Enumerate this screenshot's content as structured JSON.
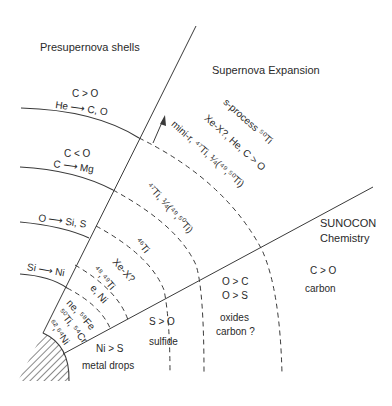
{
  "titles": {
    "presupernova": "Presupernova shells",
    "expansion": "Supernova Expansion",
    "sunocon_1": "SUNOCON",
    "sunocon_2": "Chemistry"
  },
  "shells": {
    "he_shell_ratio": "C > O",
    "he_shell_burn": "He ⟶ C, O",
    "c_shell_ratio": "C < O",
    "c_shell_burn": "C ⟶ Mg",
    "o_shell_burn": "O ⟶ Si, S",
    "si_shell_burn": "Si ⟶ Ni"
  },
  "expansion_labels": {
    "s_process": "s-process ⁵⁰Ti",
    "xe_he": "Xe-X?, He, C > O",
    "mini_r": "mini-r, ⁴⁷Ti, ¼(⁴⁹,⁵⁰Ti)",
    "ti47": "⁴⁷Ti, ¼(⁴⁹,⁵⁰Ti)",
    "ti46": "⁴⁶Ti",
    "xe_x": "Xe-X?",
    "ti48_49": "⁴⁸,⁴⁹Ti",
    "e_ni": "e, Ni",
    "ne_fe": "ne, ⁵⁸Fe",
    "ti50_cr": "⁵⁰Ti, ⁵⁴Cr",
    "ni62_64": "⁶²,⁶⁴Ni"
  },
  "chemistry_labels": {
    "metal_ratio": "Ni > S",
    "metal_name": "metal drops",
    "sulfide_ratio": "S > O",
    "sulfide_name": "sulfide",
    "oxide_ratio_1": "O > C",
    "oxide_ratio_2": "O > S",
    "oxide_name_1": "oxides",
    "oxide_name_2": "carbon ?",
    "carbon_ratio": "C > O",
    "carbon_name": "carbon"
  },
  "colors": {
    "line": "#3a3a3a",
    "text": "#2a2a2a",
    "background": "#ffffff"
  }
}
